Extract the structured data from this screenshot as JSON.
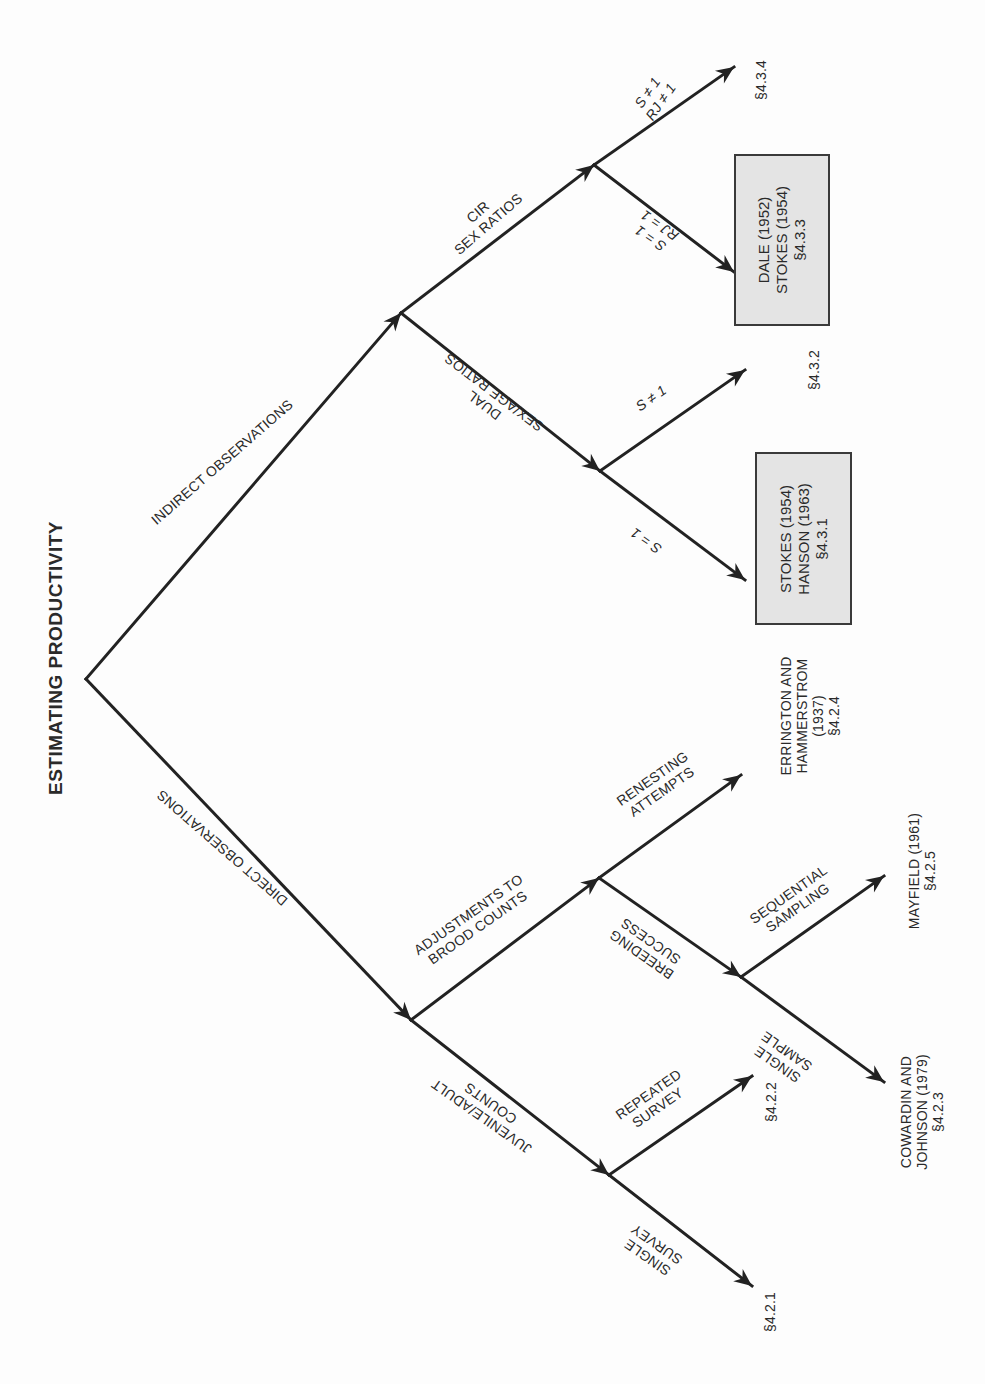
{
  "title": "ESTIMATING PRODUCTIVITY",
  "colors": {
    "line": "#222222",
    "box_fill": "#e4e4e4",
    "box_border": "#3a3a3a",
    "text": "#2a2a2a"
  },
  "nodes": {
    "root": [
      86,
      679
    ],
    "indirect": [
      401,
      313
    ],
    "cir": [
      594,
      165
    ],
    "dual": [
      600,
      471
    ],
    "direct": [
      411,
      1020
    ],
    "adjust": [
      599,
      878
    ],
    "breeding": [
      741,
      977
    ],
    "juvenile": [
      609,
      1175
    ]
  },
  "edges": [
    {
      "id": "root-indirect",
      "from": "root",
      "to": [
        401,
        313
      ],
      "arrow": true
    },
    {
      "id": "indirect-cir",
      "from": "indirect",
      "to": [
        594,
        165
      ],
      "arrow": true
    },
    {
      "id": "cir-434",
      "from": "cir",
      "to": [
        734,
        67
      ],
      "arrow": true
    },
    {
      "id": "cir-433",
      "from": "cir",
      "to": [
        734,
        272
      ],
      "arrow": true
    },
    {
      "id": "indirect-dual",
      "from": "indirect",
      "to": [
        600,
        471
      ],
      "arrow": true
    },
    {
      "id": "dual-432",
      "from": "dual",
      "to": [
        745,
        370
      ],
      "arrow": true
    },
    {
      "id": "dual-431",
      "from": "dual",
      "to": [
        745,
        580
      ],
      "arrow": true
    },
    {
      "id": "root-direct",
      "from": "root",
      "to": [
        411,
        1020
      ],
      "arrow": true
    },
    {
      "id": "direct-adjust",
      "from": "direct",
      "to": [
        599,
        878
      ],
      "arrow": true
    },
    {
      "id": "adjust-424",
      "from": "adjust",
      "to": [
        741,
        775
      ],
      "arrow": true
    },
    {
      "id": "adjust-breeding",
      "from": "adjust",
      "to": [
        741,
        977
      ],
      "arrow": true
    },
    {
      "id": "breeding-425",
      "from": "breeding",
      "to": [
        884,
        876
      ],
      "arrow": true
    },
    {
      "id": "breeding-423",
      "from": "breeding",
      "to": [
        884,
        1082
      ],
      "arrow": true
    },
    {
      "id": "direct-juvenile",
      "from": "direct",
      "to": [
        609,
        1175
      ],
      "arrow": true
    },
    {
      "id": "juvenile-422",
      "from": "juvenile",
      "to": [
        752,
        1076
      ],
      "arrow": true
    },
    {
      "id": "juvenile-421",
      "from": "juvenile",
      "to": [
        752,
        1286
      ],
      "arrow": true
    }
  ],
  "edge_labels": {
    "indirect_observations": {
      "text": "INDIRECT OBSERVATIONS",
      "x": 222,
      "y": 462,
      "rotate": -41
    },
    "cir_sex_ratios": {
      "text": "CIR\nSEX RATIOS",
      "x": 483,
      "y": 218,
      "rotate": -41
    },
    "s_ne_1_rj_ne_1": {
      "text": "S ≠ 1\nRJ ≠ 1",
      "x": 654,
      "y": 97,
      "rotate": -55
    },
    "s_eq_1_rj_eq_1": {
      "text": "S = 1\nRJ = 1",
      "x": 655,
      "y": 232,
      "rotate": 215
    },
    "dual_sexage_ratios": {
      "text": "DUAL\nSEX/AGE RATIOS",
      "x": 489,
      "y": 399,
      "rotate": 217
    },
    "s_ne_1": {
      "text": "S ≠ 1",
      "x": 651,
      "y": 398,
      "rotate": -35
    },
    "s_eq_1": {
      "text": "S = 1",
      "x": 646,
      "y": 541,
      "rotate": 215
    },
    "direct_observations": {
      "text": "DIRECT OBSERVATIONS",
      "x": 222,
      "y": 848,
      "rotate": 221
    },
    "adjustments_brood": {
      "text": "ADJUSTMENTS TO\nBROOD COUNTS",
      "x": 473,
      "y": 921,
      "rotate": -35
    },
    "renesting_attempts": {
      "text": "RENESTING\nATTEMPTS",
      "x": 657,
      "y": 785,
      "rotate": -35
    },
    "breeding_success": {
      "text": "BREEDING\nSUCCESS",
      "x": 646,
      "y": 948,
      "rotate": 215
    },
    "sequential_sampling": {
      "text": "SEQUENTIAL\nSAMPLING",
      "x": 793,
      "y": 901,
      "rotate": -35
    },
    "single_sample": {
      "text": "SINGLE\nSAMPLE",
      "x": 782,
      "y": 1058,
      "rotate": 215
    },
    "juvenile_adult_counts": {
      "text": "JUVENILE/ADULT\nCOUNTS",
      "x": 486,
      "y": 1110,
      "rotate": 215
    },
    "repeated_survey": {
      "text": "REPEATED\nSURVEY",
      "x": 653,
      "y": 1101,
      "rotate": -35
    },
    "single_survey": {
      "text": "SINGLE\nSURVEY",
      "x": 652,
      "y": 1251,
      "rotate": 215
    }
  },
  "endpoints": {
    "sec_434": {
      "text": "§4.3.4",
      "x": 761,
      "y": 80
    },
    "sec_432": {
      "text": "§4.3.2",
      "x": 814,
      "y": 370
    },
    "errington": {
      "text": "ERRINGTON AND\nHAMMERSTROM\n(1937)\n§4.2.4",
      "x": 810,
      "y": 716
    },
    "mayfield": {
      "text": "MAYFIELD (1961)\n§4.2.5",
      "x": 922,
      "y": 871
    },
    "cowardin": {
      "text": "COWARDIN AND\nJOHNSON (1979)\n§4.2.3",
      "x": 922,
      "y": 1112
    },
    "sec_422": {
      "text": "§4.2.2",
      "x": 771,
      "y": 1102
    },
    "sec_421": {
      "text": "§4.2.1",
      "x": 770,
      "y": 1312
    }
  },
  "boxes": {
    "dale_stokes": {
      "text": "DALE (1952)\nSTOKES (1954)\n§4.3.3",
      "x": 734,
      "y": 154,
      "w": 96,
      "h": 172
    },
    "stokes_hanson": {
      "text": "STOKES (1954)\nHANSON (1963)\n§4.3.1",
      "x": 755,
      "y": 452,
      "w": 97,
      "h": 173
    }
  },
  "title_pos": {
    "x": 56,
    "y": 658
  }
}
